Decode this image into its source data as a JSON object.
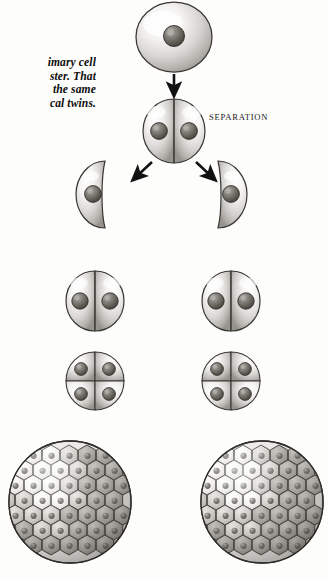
{
  "page": {
    "background_color": "#fdfdfc",
    "ink_color": "#1b1b1b",
    "width": 328,
    "height": 578
  },
  "caption": {
    "note": "bold italic serif paragraph, clipped by the left edge of the scan",
    "lines": [
      "imary cell",
      "ster. That",
      "the same",
      "cal twins."
    ],
    "line_1": "imary cell",
    "line_2": "ster. That",
    "line_3": "the same",
    "line_4": "cal twins."
  },
  "labels": {
    "separation": "SEPARATION"
  },
  "footer": {
    "sliver": ""
  },
  "diagram": {
    "type": "embryonic-cleavage-flowchart",
    "style": "grayscale airbrush halftone illustration",
    "stages": [
      {
        "id": "zygote",
        "label": "single primary cell",
        "cell_count": 1,
        "nuclei": 1,
        "row": 1,
        "branch": "center"
      },
      {
        "id": "two-cell",
        "label": "two-cell stage before separation",
        "cell_count": 2,
        "nuclei": 2,
        "row": 2,
        "branch": "center"
      },
      {
        "id": "separated-half-left",
        "label": "separated single blastomere",
        "cell_count": 1,
        "nuclei": 1,
        "row": 3,
        "branch": "left"
      },
      {
        "id": "separated-half-right",
        "label": "separated single blastomere",
        "cell_count": 1,
        "nuclei": 1,
        "row": 3,
        "branch": "right"
      },
      {
        "id": "two-cell-left",
        "label": "two-cell stage",
        "cell_count": 2,
        "nuclei": 2,
        "row": 4,
        "branch": "left"
      },
      {
        "id": "two-cell-right",
        "label": "two-cell stage",
        "cell_count": 2,
        "nuclei": 2,
        "row": 4,
        "branch": "right"
      },
      {
        "id": "four-cell-left",
        "label": "four-cell stage",
        "cell_count": 4,
        "nuclei": 4,
        "row": 5,
        "branch": "left"
      },
      {
        "id": "four-cell-right",
        "label": "four-cell stage",
        "cell_count": 4,
        "nuclei": 4,
        "row": 5,
        "branch": "right"
      },
      {
        "id": "morula-left",
        "label": "morula / multicellular blastula",
        "cell_count": 37,
        "nuclei": 37,
        "row": 6,
        "branch": "left"
      },
      {
        "id": "morula-right",
        "label": "morula / multicellular blastula",
        "cell_count": 37,
        "nuclei": 37,
        "row": 6,
        "branch": "right"
      }
    ],
    "arrows": [
      {
        "id": "arrow-zygote-to-two-cell",
        "direction": "down",
        "from": "zygote",
        "to": "two-cell"
      },
      {
        "id": "arrow-split-left",
        "direction": "down-left",
        "from": "two-cell",
        "to": "separated-half-left"
      },
      {
        "id": "arrow-split-right",
        "direction": "down-right",
        "from": "two-cell",
        "to": "separated-half-right"
      }
    ]
  }
}
